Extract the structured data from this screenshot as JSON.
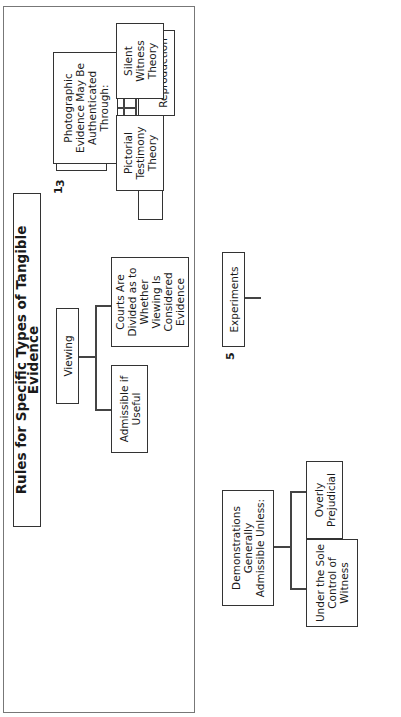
{
  "title": "Rules for Specific Types of Tangible Evidence",
  "sections": [
    {
      "number": "1",
      "root": "Maps, Charts and Diagrams Admissible if:",
      "children": [
        "Useful",
        "Accurate Reproduction"
      ]
    },
    {
      "number": "2",
      "root": "Viewing",
      "children": [
        "Admissible if Useful",
        "Courts Are Divided as to Whether Viewing Is Considered Evidence"
      ]
    },
    {
      "number": "3",
      "root": "Photographic Evidence May Be Authenticated Through:",
      "children": [
        "Pictorial Testimony Theory",
        "Silent Witness Theory"
      ]
    },
    {
      "number": "4",
      "root": "Demonstrations Generally Admissible Unless:",
      "children": [
        "Under the Sole Control of Witness",
        "Overly Prejudicial"
      ]
    },
    {
      "number": "5",
      "root": "Experiments",
      "children": [
        "Admissible If:",
        "By Jury: Permitted If Only Admitted Evidence Is Used"
      ],
      "grandchildren": [
        "Substantially Similar Conditions",
        "Little Unfair Prejudice"
      ]
    }
  ]
}
